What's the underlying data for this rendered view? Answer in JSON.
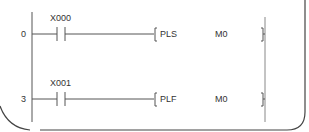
{
  "diagram": {
    "type": "ladder-logic",
    "rungs": [
      {
        "step": "0",
        "contact": {
          "device": "X000",
          "type": "normally-open"
        },
        "instruction": {
          "mnemonic": "PLS",
          "operand": "M0"
        }
      },
      {
        "step": "3",
        "contact": {
          "device": "X001",
          "type": "normally-open"
        },
        "instruction": {
          "mnemonic": "PLF",
          "operand": "M0"
        }
      }
    ],
    "colors": {
      "line": "#555555",
      "text": "#333333",
      "border": "#444444",
      "background": "#ffffff"
    }
  }
}
